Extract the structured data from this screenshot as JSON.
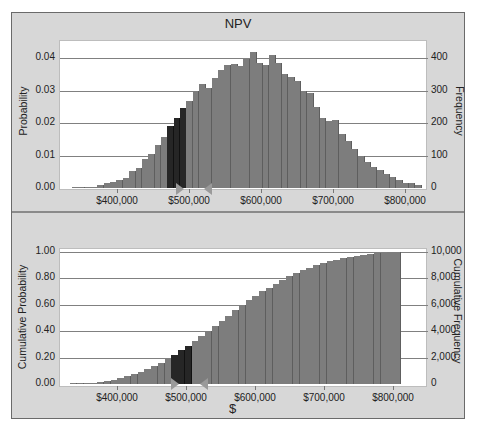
{
  "chart_data": [
    {
      "type": "bar",
      "title": "NPV",
      "xlabel": "",
      "ylabel": "Probability",
      "ylabel_right": "Frequency",
      "ylim": [
        0,
        0.045
      ],
      "ylim_right": [
        0,
        450
      ],
      "yticks": [
        "0.00",
        "0.01",
        "0.02",
        "0.03",
        "0.04"
      ],
      "yticks_right": [
        "0",
        "100",
        "200",
        "300",
        "400"
      ],
      "xticks": [
        "$400,000",
        "$500,000",
        "$600,000",
        "$700,000",
        "$800,000"
      ],
      "grid": true,
      "bin_width": 10000,
      "bin_start": 340000,
      "highlight_range": [
        490000,
        520000
      ],
      "values": [
        0.0002,
        0.0001,
        0.0004,
        0.0001,
        0.0008,
        0.0014,
        0.002,
        0.0025,
        0.003,
        0.0053,
        0.0061,
        0.009,
        0.0106,
        0.0132,
        0.0158,
        0.0192,
        0.0214,
        0.0246,
        0.0267,
        0.0299,
        0.032,
        0.0309,
        0.0339,
        0.0363,
        0.0378,
        0.0381,
        0.0375,
        0.0396,
        0.0418,
        0.0384,
        0.0378,
        0.0408,
        0.0386,
        0.035,
        0.0342,
        0.033,
        0.0299,
        0.0291,
        0.025,
        0.0214,
        0.0207,
        0.021,
        0.0166,
        0.0145,
        0.012,
        0.0098,
        0.0079,
        0.0064,
        0.0054,
        0.0044,
        0.0033,
        0.0025,
        0.0016,
        0.0016,
        0.0008
      ]
    },
    {
      "type": "bar",
      "title": "",
      "xlabel": "$",
      "ylabel": "Cumulative Probability",
      "ylabel_right": "Cumulative Frequency",
      "ylim": [
        0,
        1.0
      ],
      "ylim_right": [
        0,
        10000
      ],
      "yticks": [
        "0.00",
        "0.20",
        "0.40",
        "0.60",
        "0.80",
        "1.00"
      ],
      "yticks_right": [
        "0",
        "2,000",
        "4,000",
        "6,000",
        "8,000",
        "10,000"
      ],
      "xticks": [
        "$400,000",
        "$500,000",
        "$600,000",
        "$700,000",
        "$800,000"
      ],
      "grid": true,
      "bin_width": 10000,
      "bin_start": 340000,
      "highlight_range": [
        490000,
        520000
      ],
      "values": [
        0.001,
        0.002,
        0.005,
        0.008,
        0.014,
        0.022,
        0.032,
        0.044,
        0.058,
        0.074,
        0.092,
        0.113,
        0.137,
        0.162,
        0.19,
        0.221,
        0.254,
        0.289,
        0.325,
        0.362,
        0.4,
        0.439,
        0.478,
        0.516,
        0.557,
        0.596,
        0.634,
        0.668,
        0.701,
        0.731,
        0.761,
        0.79,
        0.817,
        0.84,
        0.861,
        0.88,
        0.898,
        0.914,
        0.929,
        0.942,
        0.954,
        0.963,
        0.971,
        0.979,
        0.986,
        0.991,
        0.995,
        0.998,
        1.0
      ]
    }
  ],
  "top": {
    "title": "NPV",
    "ylabel": "Probability",
    "ylabel_right": "Frequency",
    "yticks": [
      "0.04",
      "0.03",
      "0.02",
      "0.01",
      "0.00"
    ],
    "yticks_right": [
      "400",
      "300",
      "200",
      "100",
      "0"
    ],
    "xticks": [
      "$400,000",
      "$500,000",
      "$600,000",
      "$700,000",
      "$800,000"
    ]
  },
  "bottom": {
    "xlabel": "$",
    "ylabel": "Cumulative Probability",
    "ylabel_right": "Cumulative Frequency",
    "yticks": [
      "1.00",
      "0.80",
      "0.60",
      "0.40",
      "0.20",
      "0.00"
    ],
    "yticks_right": [
      "10,000",
      "8,000",
      "6,000",
      "4,000",
      "2,000",
      "0"
    ],
    "xticks": [
      "$400,000",
      "$500,000",
      "$600,000",
      "$700,000",
      "$800,000"
    ]
  },
  "colors": {
    "bar": "#7d7d7d",
    "bar_highlight": "#262626",
    "panel": "#d7d7d7",
    "plot": "#ffffff",
    "grid": "#808080"
  }
}
